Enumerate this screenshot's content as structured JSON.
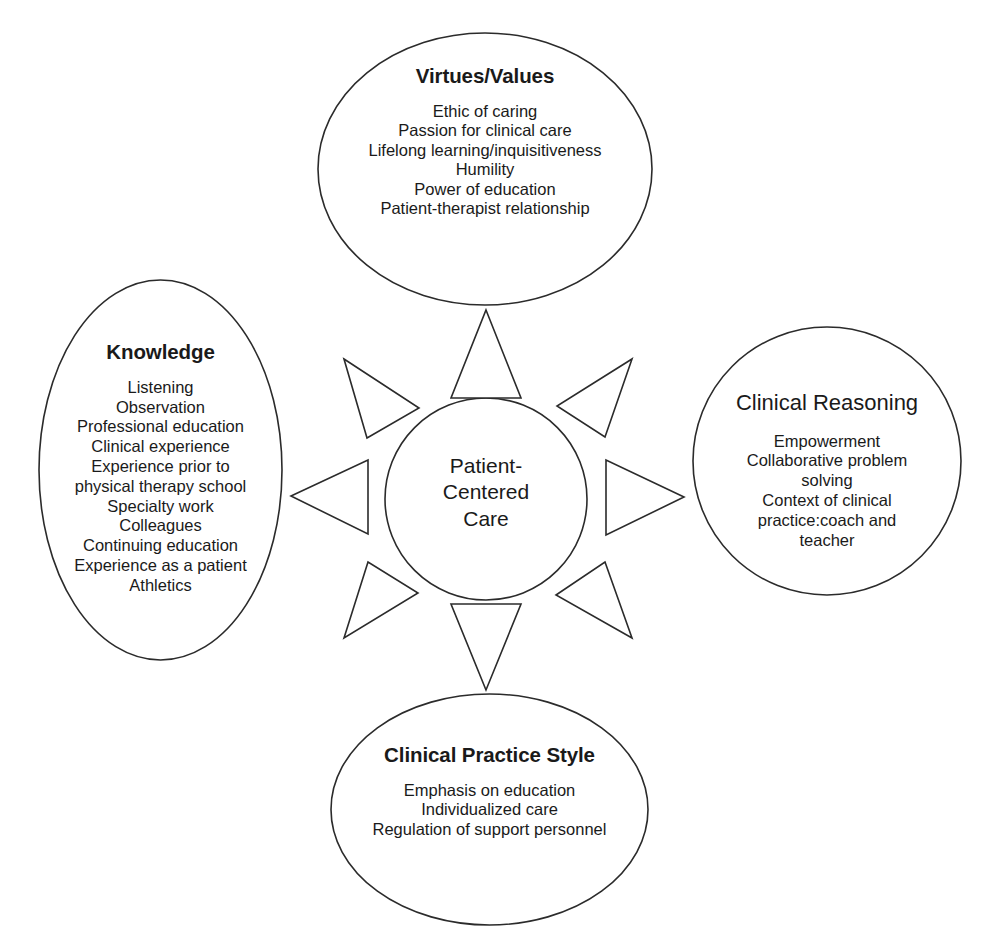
{
  "diagram": {
    "stroke_color": "#2b2b2b",
    "fill_color": "#ffffff",
    "text_color": "#1a1a1a"
  },
  "center": {
    "name": "Patient-Centered Care",
    "lines": [
      "Patient-",
      "Centered",
      "Care"
    ]
  },
  "nodes": {
    "top": {
      "title": "Virtues/Values",
      "items": [
        "Ethic of caring",
        "Passion for clinical care",
        "Lifelong learning/inquisitiveness",
        "Humility",
        "Power of education",
        "Patient-therapist relationship"
      ]
    },
    "left": {
      "title": "Knowledge",
      "items": [
        "Listening",
        "Observation",
        "Professional education",
        "Clinical experience",
        "Experience prior to",
        "physical therapy school",
        "Specialty work",
        "Colleagues",
        "Continuing education",
        "Experience as a patient",
        "Athletics"
      ]
    },
    "right": {
      "title": "Clinical Reasoning",
      "items": [
        "Empowerment",
        "Collaborative problem",
        "solving",
        "Context of clinical",
        "practice:coach and",
        "teacher"
      ]
    },
    "bottom": {
      "title": "Clinical Practice Style",
      "items": [
        "Emphasis on education",
        "Individualized care",
        "Regulation of support personnel"
      ]
    }
  },
  "arrows": [
    {
      "direction": "up",
      "label": "arrow-to-virtues-values"
    },
    {
      "direction": "down",
      "label": "arrow-to-clinical-practice-style"
    },
    {
      "direction": "left",
      "label": "arrow-to-knowledge"
    },
    {
      "direction": "right",
      "label": "arrow-to-clinical-reasoning"
    },
    {
      "direction": "up-left",
      "label": "arrow-upper-left"
    },
    {
      "direction": "up-right",
      "label": "arrow-upper-right"
    },
    {
      "direction": "down-left",
      "label": "arrow-lower-left"
    },
    {
      "direction": "down-right",
      "label": "arrow-lower-right"
    }
  ]
}
